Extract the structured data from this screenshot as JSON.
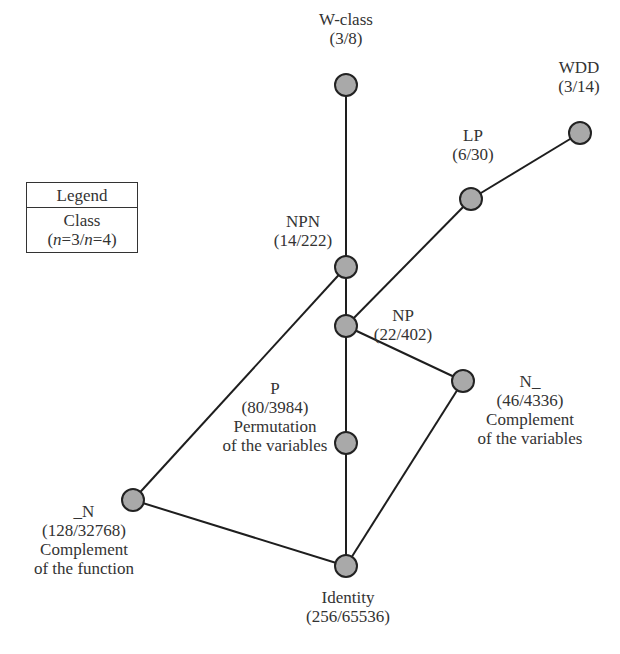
{
  "legend": {
    "title": "Legend",
    "line1": "Class",
    "line2_parts": [
      "(",
      "n",
      "=3/",
      "n",
      "=4)"
    ]
  },
  "nodes": [
    {
      "id": "w-class",
      "name": "W-class",
      "count": "(3/8)",
      "desc": [],
      "x": 346,
      "y": 85
    },
    {
      "id": "wdd",
      "name": "WDD",
      "count": "(3/14)",
      "desc": [],
      "x": 580,
      "y": 133
    },
    {
      "id": "lp",
      "name": "LP",
      "count": "(6/30)",
      "desc": [],
      "x": 471,
      "y": 199
    },
    {
      "id": "npn",
      "name": "NPN",
      "count": "(14/222)",
      "desc": [],
      "x": 346,
      "y": 267
    },
    {
      "id": "np",
      "name": "NP",
      "count": "(22/402)",
      "desc": [],
      "x": 346,
      "y": 326
    },
    {
      "id": "n-var",
      "name": "N_",
      "count": "(46/4336)",
      "desc": [
        "Complement",
        "of the variables"
      ],
      "x": 463,
      "y": 381
    },
    {
      "id": "p",
      "name": "P",
      "count": "(80/3984)",
      "desc": [
        "Permutation",
        "of the variables"
      ],
      "x": 346,
      "y": 443
    },
    {
      "id": "n-func",
      "name": "_N",
      "count": "(128/32768)",
      "desc": [
        "Complement",
        "of the function"
      ],
      "x": 133,
      "y": 500
    },
    {
      "id": "identity",
      "name": "Identity",
      "count": "(256/65536)",
      "desc": [],
      "x": 346,
      "y": 566
    }
  ],
  "edges": [
    [
      "w-class",
      "npn"
    ],
    [
      "npn",
      "np"
    ],
    [
      "np",
      "p"
    ],
    [
      "p",
      "identity"
    ],
    [
      "wdd",
      "lp"
    ],
    [
      "lp",
      "np"
    ],
    [
      "npn",
      "n-func"
    ],
    [
      "np",
      "n-var"
    ],
    [
      "n-var",
      "identity"
    ],
    [
      "n-func",
      "identity"
    ]
  ],
  "labels": {
    "w-class": {
      "name": "W-class",
      "count": "(3/8)"
    },
    "wdd": {
      "name": "WDD",
      "count": "(3/14)"
    },
    "lp": {
      "name": "LP",
      "count": "(6/30)"
    },
    "npn": {
      "name": "NPN",
      "count": "(14/222)"
    },
    "np": {
      "name": "NP",
      "count": "(22/402)"
    },
    "n_var": {
      "name": "N_",
      "count": "(46/4336)",
      "desc1": "Complement",
      "desc2": "of the variables"
    },
    "p": {
      "name": "P",
      "count": "(80/3984)",
      "desc1": "Permutation",
      "desc2": "of the variables"
    },
    "n_func": {
      "name": "_N",
      "count": "(128/32768)",
      "desc1": "Complement",
      "desc2": "of the function"
    },
    "identity": {
      "name": "Identity",
      "count": "(256/65536)"
    }
  },
  "colors": {
    "node_fill": "#a9a9a9",
    "node_stroke": "#222222",
    "edge": "#1e1e1e",
    "text": "#333333"
  }
}
